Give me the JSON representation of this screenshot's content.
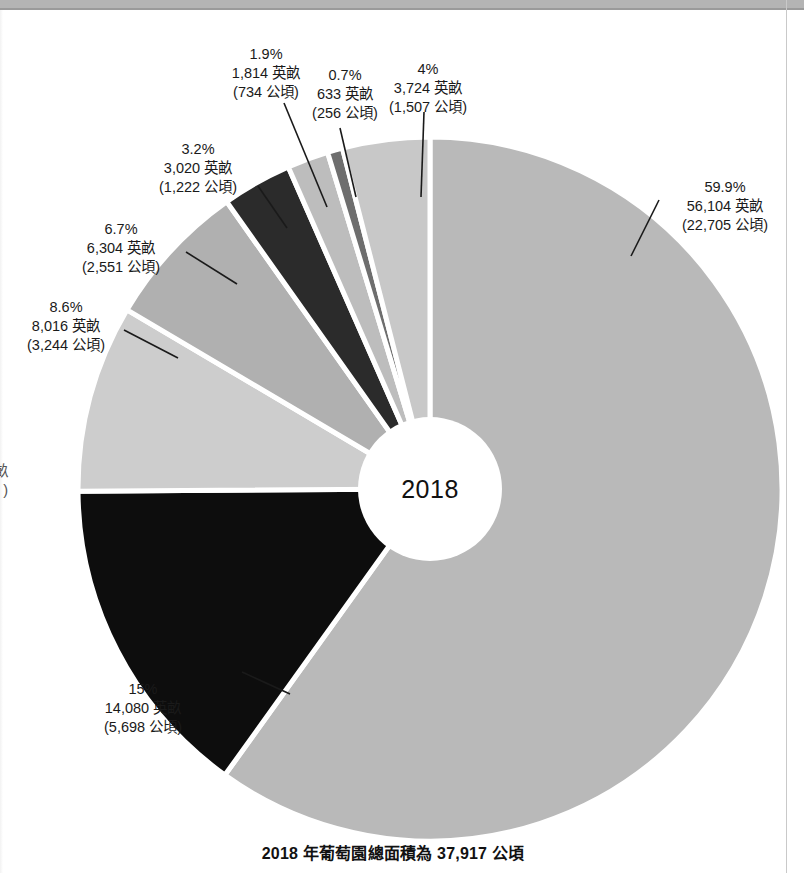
{
  "chart_data": {
    "type": "pie",
    "variant": "donut",
    "title": "",
    "center_label": "2018",
    "caption": "2018 年葡萄園總面積為 37,917 公頃",
    "unit_acres": "英畝",
    "unit_hectares": "公頃",
    "total_hectares": 37917,
    "legend": "none",
    "grid": false,
    "start_angle_deg": -90,
    "direction": "clockwise",
    "categories": [
      "59.9%",
      "15%",
      "8.6%",
      "6.7%",
      "3.2%",
      "1.9%",
      "0.7%",
      "4%"
    ],
    "values": [
      59.9,
      15,
      8.6,
      6.7,
      3.2,
      1.9,
      0.7,
      4
    ],
    "acres": [
      56104,
      14080,
      8016,
      6304,
      3020,
      1814,
      633,
      3724
    ],
    "hectares": [
      22705,
      5698,
      3244,
      2551,
      1222,
      734,
      256,
      1507
    ],
    "colors": [
      "#b9b9b9",
      "#0d0d0d",
      "#cdcdcd",
      "#b0b0b0",
      "#2b2b2b",
      "#bdbdbd",
      "#6e6e6e",
      "#c8c8c8"
    ],
    "slices": [
      {
        "id": "slice-1",
        "percent_label": "59.9%",
        "acres_label": "56,104 英畝",
        "hectares_label": "(22,705 公頃)",
        "value": 59.9,
        "acres": 56104,
        "hectares": 22705,
        "color": "#b9b9b9"
      },
      {
        "id": "slice-2",
        "percent_label": "15%",
        "acres_label": "14,080 英畝",
        "hectares_label": "(5,698 公頃)",
        "value": 15,
        "acres": 14080,
        "hectares": 5698,
        "color": "#0d0d0d"
      },
      {
        "id": "slice-3",
        "percent_label": "8.6%",
        "acres_label": "8,016 英畝",
        "hectares_label": "(3,244 公頃)",
        "value": 8.6,
        "acres": 8016,
        "hectares": 3244,
        "color": "#cdcdcd"
      },
      {
        "id": "slice-4",
        "percent_label": "6.7%",
        "acres_label": "6,304 英畝",
        "hectares_label": "(2,551 公頃)",
        "value": 6.7,
        "acres": 6304,
        "hectares": 2551,
        "color": "#b0b0b0"
      },
      {
        "id": "slice-5",
        "percent_label": "3.2%",
        "acres_label": "3,020 英畝",
        "hectares_label": "(1,222 公頃)",
        "value": 3.2,
        "acres": 3020,
        "hectares": 1222,
        "color": "#2b2b2b"
      },
      {
        "id": "slice-6",
        "percent_label": "1.9%",
        "acres_label": "1,814 英畝",
        "hectares_label": "(734 公頃)",
        "value": 1.9,
        "acres": 1814,
        "hectares": 734,
        "color": "#bdbdbd"
      },
      {
        "id": "slice-7",
        "percent_label": "0.7%",
        "acres_label": "633 英畝",
        "hectares_label": "(256 公頃)",
        "value": 0.7,
        "acres": 633,
        "hectares": 256,
        "color": "#6e6e6e"
      },
      {
        "id": "slice-8",
        "percent_label": "4%",
        "acres_label": "3,724 英畝",
        "hectares_label": "(1,507 公頃)",
        "value": 4,
        "acres": 3724,
        "hectares": 1507,
        "color": "#c8c8c8"
      }
    ]
  },
  "clipped_left_label": {
    "acres_fragment": "畝",
    "hectares_fragment": ")"
  }
}
